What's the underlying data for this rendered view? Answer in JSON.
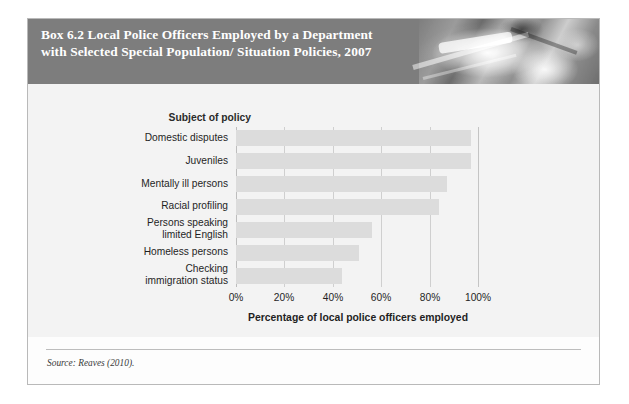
{
  "box": {
    "title": "Box 6.2   Local Police Officers Employed by a Department with Selected Special Population/ Situation Policies, 2007",
    "header_photo_alt": "police-photo",
    "source_note": "Source: Reaves (2010)."
  },
  "chart_data": {
    "type": "bar",
    "orientation": "horizontal",
    "title": "",
    "category_axis_title": "Subject of policy",
    "xlabel": "Percentage of local police officers employed",
    "ylabel": "",
    "categories": [
      "Domestic disputes",
      "Juveniles",
      "Mentally ill persons",
      "Racial profiling",
      "Persons speaking limited English",
      "Homeless persons",
      "Checking immigration status"
    ],
    "category_lines": [
      [
        "Domestic disputes"
      ],
      [
        "Juveniles"
      ],
      [
        "Mentally ill persons"
      ],
      [
        "Racial profiling"
      ],
      [
        "Persons speaking",
        "limited English"
      ],
      [
        "Homeless persons"
      ],
      [
        "Checking",
        "immigration status"
      ]
    ],
    "values": [
      97,
      97,
      87,
      84,
      56,
      51,
      44
    ],
    "xlim": [
      0,
      100
    ],
    "xticks": [
      0,
      20,
      40,
      60,
      80,
      100
    ],
    "xtick_labels": [
      "0%",
      "20%",
      "40%",
      "60%",
      "80%",
      "100%"
    ],
    "grid": true,
    "legend": "none",
    "bar_color": "#dcdcdc",
    "plot_background": "#f3f3f3",
    "header_color": "#7d7d7d"
  }
}
